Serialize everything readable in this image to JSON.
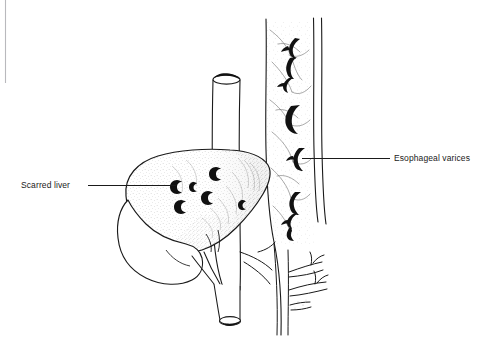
{
  "figure": {
    "background_color": "#ffffff",
    "ink_color": "#1a1a1a",
    "stipple_color": "#4a4a4a",
    "artifact_line_color": "#b9b9bd"
  },
  "labels": {
    "scarred_liver": "Scarred liver",
    "esophageal_varices": "Esophageal varices"
  },
  "leaders": {
    "scarred_liver_leader": "leader-line-left",
    "esophageal_varices_leader": "leader-line-right"
  },
  "anatomy": {
    "esophagus_tube": "esophagus-tube",
    "esophagus_lumen_top": "esophagus-lumen-top-opening",
    "esophagus_lumen_bottom": "esophagus-lumen-bottom-opening",
    "liver_right_lobe": "liver-right-lobe",
    "liver_left_lobe": "liver-left-lobe",
    "liver_nodules": "liver-scar-nodules",
    "vein_wall_left": "vein-wall-left",
    "vein_wall_right": "vein-wall-right",
    "varices": "esophageal-varices-vessels",
    "vein_branches": "vein-branches-lower",
    "gallbladder": "gallbladder"
  }
}
